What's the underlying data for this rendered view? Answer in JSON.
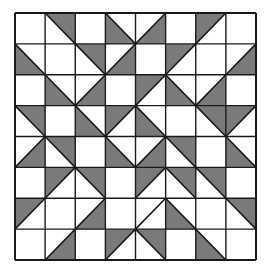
{
  "diagram": {
    "type": "quilt-block",
    "rows": 8,
    "cols": 8,
    "colors": {
      "background": "#ffffff",
      "fill": "#7a7a7a",
      "line": "#1a1a1a"
    },
    "legend": {
      "-": "blank square",
      "TR": "diagonal TL-BR, top-right half shaded",
      "BL": "diagonal TL-BR, bottom-left half shaded",
      "TL": "diagonal TR-BL, top-left half shaded",
      "BR": "diagonal TR-BL, bottom-right half shaded",
      "L": "diagonal BL-TR, unshaded"
    },
    "cells": [
      [
        "-",
        "TR",
        "-",
        "BL",
        "BR",
        "-",
        "TL",
        "-"
      ],
      [
        "BL",
        "-",
        "TR",
        "BR",
        "-",
        "TL",
        "-",
        "BR"
      ],
      [
        "-",
        "BL",
        "BR",
        "-",
        "TL",
        "BL",
        "BR",
        "-"
      ],
      [
        "TR",
        "-",
        "BL",
        "TL",
        "BL",
        "-",
        "TR",
        "TL"
      ],
      [
        "BR",
        "TR",
        "-",
        "BL",
        "BR",
        "TR",
        "-",
        "BL"
      ],
      [
        "-",
        "TL",
        "TR",
        "-",
        "TL",
        "TR",
        "TR",
        "-"
      ],
      [
        "TL",
        "-",
        "BR",
        "-",
        "L",
        "BL",
        "-",
        "TR"
      ],
      [
        "-",
        "BR",
        "-",
        "TL",
        "TR",
        "-",
        "BL",
        "-"
      ]
    ]
  }
}
